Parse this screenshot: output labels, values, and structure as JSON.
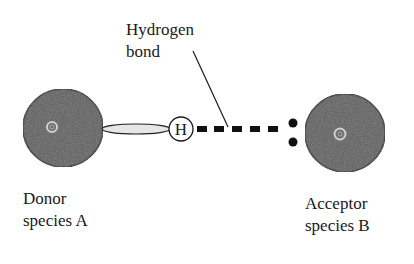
{
  "diagram": {
    "type": "hydrogen-bond-schematic",
    "labels": {
      "hydrogen_bond": {
        "line1": "Hydrogen",
        "line2": "bond"
      },
      "donor": {
        "line1": "Donor",
        "line2": "species A"
      },
      "acceptor": {
        "line1": "Acceptor",
        "line2": "species B"
      },
      "hydrogen_atom": "H"
    },
    "nodes": [
      {
        "id": "donor-A",
        "shape": "sphere",
        "cx": 63,
        "cy": 128,
        "r": 40
      },
      {
        "id": "hydrogen",
        "shape": "circle",
        "cx": 181,
        "cy": 129,
        "r": 12,
        "label": "H"
      },
      {
        "id": "acceptor-B",
        "shape": "sphere",
        "cx": 345,
        "cy": 133,
        "r": 40
      }
    ],
    "edges": [
      {
        "from": "donor-A",
        "to": "hydrogen",
        "style": "covalent-ellipse"
      },
      {
        "from": "hydrogen",
        "to": "acceptor-B",
        "style": "dashed",
        "meaning": "hydrogen bond"
      }
    ],
    "lone_pair": {
      "count": 2,
      "on": "acceptor-B"
    },
    "colors": {
      "sphere_fill": "#5e5e5e",
      "sphere_stroke": "#2a2a2a",
      "ring": "#cfcfcf",
      "bond_ellipse_fill": "#e6e6e6",
      "dash": "#111111",
      "text": "#1a1a1a"
    }
  }
}
